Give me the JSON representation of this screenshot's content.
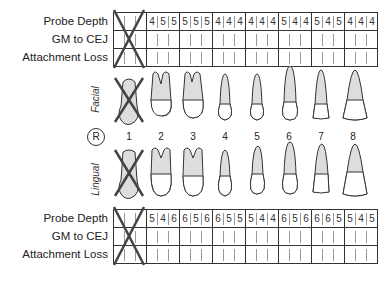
{
  "row_labels": [
    "Probe Depth",
    "GM to CEJ",
    "Attachment Loss"
  ],
  "side_labels": {
    "facial": "Facial",
    "lingual": "Lingual"
  },
  "quadrant_marker": "R",
  "tooth_numbers": [
    "1",
    "2",
    "3",
    "4",
    "5",
    "6",
    "7",
    "8"
  ],
  "missing_teeth": [
    "1"
  ],
  "facial_chart": {
    "probe_depth": [
      [
        "",
        "",
        ""
      ],
      [
        "4",
        "5",
        "5"
      ],
      [
        "5",
        "5",
        "5"
      ],
      [
        "4",
        "4",
        "4"
      ],
      [
        "4",
        "4",
        "4"
      ],
      [
        "5",
        "4",
        "4"
      ],
      [
        "5",
        "4",
        "5"
      ],
      [
        "4",
        "4",
        "4"
      ]
    ],
    "gm_to_cej": [
      [
        "",
        "",
        ""
      ],
      [
        "",
        "",
        ""
      ],
      [
        "",
        "",
        ""
      ],
      [
        "",
        "",
        ""
      ],
      [
        "",
        "",
        ""
      ],
      [
        "",
        "",
        ""
      ],
      [
        "",
        "",
        ""
      ],
      [
        "",
        "",
        ""
      ]
    ],
    "attachment_loss": [
      [
        "",
        "",
        ""
      ],
      [
        "",
        "",
        ""
      ],
      [
        "",
        "",
        ""
      ],
      [
        "",
        "",
        ""
      ],
      [
        "",
        "",
        ""
      ],
      [
        "",
        "",
        ""
      ],
      [
        "",
        "",
        ""
      ],
      [
        "",
        "",
        ""
      ]
    ]
  },
  "lingual_chart": {
    "probe_depth": [
      [
        "",
        "",
        ""
      ],
      [
        "5",
        "4",
        "6"
      ],
      [
        "6",
        "5",
        "6"
      ],
      [
        "6",
        "5",
        "5"
      ],
      [
        "5",
        "4",
        "4"
      ],
      [
        "6",
        "5",
        "6"
      ],
      [
        "6",
        "6",
        "5"
      ],
      [
        "5",
        "4",
        "5"
      ]
    ],
    "gm_to_cej": [
      [
        "",
        "",
        ""
      ],
      [
        "",
        "",
        ""
      ],
      [
        "",
        "",
        ""
      ],
      [
        "",
        "",
        ""
      ],
      [
        "",
        "",
        ""
      ],
      [
        "",
        "",
        ""
      ],
      [
        "",
        "",
        ""
      ],
      [
        "",
        "",
        ""
      ]
    ],
    "attachment_loss": [
      [
        "",
        "",
        ""
      ],
      [
        "",
        "",
        ""
      ],
      [
        "",
        "",
        ""
      ],
      [
        "",
        "",
        ""
      ],
      [
        "",
        "",
        ""
      ],
      [
        "",
        "",
        ""
      ],
      [
        "",
        "",
        ""
      ],
      [
        "",
        "",
        ""
      ]
    ]
  },
  "colors": {
    "line": "#333333",
    "root_fill": "#d9d9d9",
    "crown_fill": "#ffffff"
  }
}
